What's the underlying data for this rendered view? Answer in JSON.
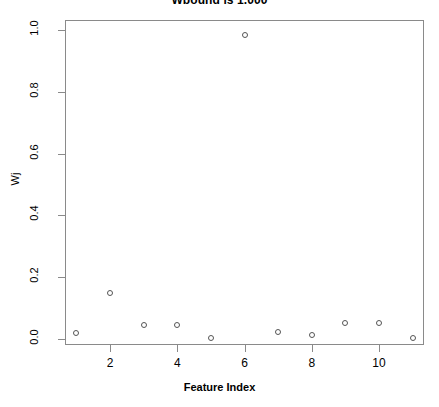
{
  "chart_data": {
    "type": "scatter",
    "title": "Wbound is 1.000",
    "xlabel": "Feature Index",
    "ylabel": "Wj",
    "x": [
      1,
      2,
      3,
      4,
      5,
      6,
      7,
      8,
      9,
      10,
      11
    ],
    "values": [
      0.019,
      0.149,
      0.045,
      0.045,
      0.002,
      0.985,
      0.023,
      0.012,
      0.053,
      0.053,
      0.003
    ],
    "xlim": [
      0.5,
      11.5
    ],
    "ylim": [
      0.0,
      1.0
    ],
    "xticks": [
      2,
      4,
      6,
      8,
      10
    ],
    "xtick_labels": [
      "2",
      "4",
      "6",
      "8",
      "10"
    ],
    "yticks": [
      0.0,
      0.2,
      0.4,
      0.6,
      0.8,
      1.0
    ],
    "ytick_labels": [
      "0.0",
      "0.2",
      "0.4",
      "0.6",
      "0.8",
      "1.0"
    ],
    "grid": false,
    "legend": false,
    "marker": "open-circle",
    "marker_color": "#555555",
    "frame_color": "#8a8a8a",
    "background": "#ffffff"
  }
}
